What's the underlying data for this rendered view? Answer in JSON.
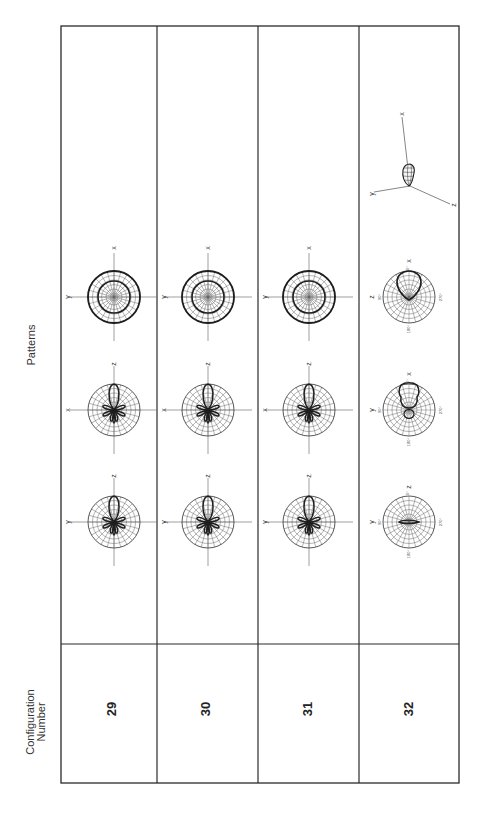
{
  "table": {
    "header_config": "Configuration\nNumber",
    "header_config_line1": "Configuration",
    "header_config_line2": "Number",
    "header_patterns": "Patterns"
  },
  "rows": [
    {
      "config_number": "29",
      "patterns": [
        {
          "type": "polar-lobed",
          "h_axis": "y",
          "v_axis": "z"
        },
        {
          "type": "polar-lobed",
          "h_axis": "x",
          "v_axis": "z"
        },
        {
          "type": "polar-concentric",
          "h_axis": "y",
          "v_axis": "x"
        }
      ]
    },
    {
      "config_number": "30",
      "patterns": [
        {
          "type": "polar-lobed",
          "h_axis": "y",
          "v_axis": "z"
        },
        {
          "type": "polar-lobed",
          "h_axis": "x",
          "v_axis": "z"
        },
        {
          "type": "polar-concentric",
          "h_axis": "y",
          "v_axis": "x"
        }
      ]
    },
    {
      "config_number": "31",
      "patterns": [
        {
          "type": "polar-lobed",
          "h_axis": "y",
          "v_axis": "z"
        },
        {
          "type": "polar-lobed",
          "h_axis": "x",
          "v_axis": "z"
        },
        {
          "type": "polar-concentric",
          "h_axis": "y",
          "v_axis": "x"
        }
      ]
    },
    {
      "config_number": "32",
      "patterns": [
        {
          "type": "polar-flat",
          "h_axis": "y",
          "v_axis": "z",
          "ticks": [
            "0°",
            "90°",
            "180°",
            "270°"
          ]
        },
        {
          "type": "polar-cardioid-notched",
          "h_axis": "y",
          "v_axis": "x",
          "ticks": [
            "0°",
            "90°",
            "180°",
            "270°"
          ]
        },
        {
          "type": "polar-cardioid",
          "h_axis": "z",
          "v_axis": "x",
          "ticks": [
            "0°",
            "90°",
            "180°",
            "270°"
          ]
        },
        {
          "type": "3d-lobe",
          "axes": [
            "x",
            "y",
            "z"
          ]
        }
      ]
    }
  ],
  "colors": {
    "line": "#2a2a2a",
    "grid": "#555555",
    "axis": "#777777"
  }
}
